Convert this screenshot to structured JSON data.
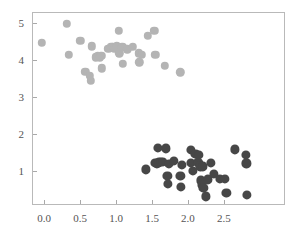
{
  "chart_data": {
    "type": "scatter",
    "title": "",
    "xlabel": "",
    "ylabel": "",
    "xlim": [
      -0.17,
      3.35
    ],
    "ylim": [
      0.08,
      5.3
    ],
    "grid": false,
    "legend": "none",
    "xticks": [
      "0.0",
      "0.5",
      "1.0",
      "1.5",
      "2.0",
      "2.5"
    ],
    "xtick_values": [
      0.0,
      0.5,
      1.0,
      1.5,
      2.0,
      2.5
    ],
    "yticks": [
      "1",
      "2",
      "3",
      "4",
      "5"
    ],
    "ytick_values": [
      1,
      2,
      3,
      4,
      5
    ],
    "series": [
      {
        "name": "cluster-light",
        "color": "#b4b4b4",
        "marker": "circle",
        "marker_size": 4.2,
        "points": [
          [
            -0.05,
            4.49
          ],
          [
            0.3,
            5.01
          ],
          [
            0.33,
            4.17
          ],
          [
            0.49,
            4.54
          ],
          [
            0.56,
            3.71
          ],
          [
            0.62,
            3.6
          ],
          [
            0.63,
            3.47
          ],
          [
            0.65,
            4.4
          ],
          [
            0.7,
            4.1
          ],
          [
            0.73,
            4.13
          ],
          [
            0.76,
            4.1
          ],
          [
            0.78,
            4.14
          ],
          [
            0.79,
            3.8
          ],
          [
            0.88,
            4.33
          ],
          [
            0.92,
            4.38
          ],
          [
            0.94,
            4.39
          ],
          [
            0.96,
            4.34
          ],
          [
            1.0,
            4.4
          ],
          [
            1.02,
            4.82
          ],
          [
            1.03,
            4.21
          ],
          [
            1.07,
            4.38
          ],
          [
            1.08,
            3.92
          ],
          [
            1.14,
            4.32
          ],
          [
            1.22,
            4.38
          ],
          [
            1.3,
            4.21
          ],
          [
            1.31,
            3.97
          ],
          [
            1.34,
            4.17
          ],
          [
            1.43,
            4.69
          ],
          [
            1.52,
            4.82
          ],
          [
            1.53,
            4.17
          ],
          [
            1.66,
            3.88
          ],
          [
            1.88,
            3.7
          ]
        ]
      },
      {
        "name": "cluster-dark",
        "color": "#474747",
        "marker": "circle",
        "marker_size": 4.6,
        "points": [
          [
            1.4,
            1.07
          ],
          [
            1.53,
            1.25
          ],
          [
            1.55,
            1.23
          ],
          [
            1.57,
            1.65
          ],
          [
            1.58,
            1.26
          ],
          [
            1.61,
            1.27
          ],
          [
            1.64,
            1.28
          ],
          [
            1.68,
            1.64
          ],
          [
            1.7,
            0.9
          ],
          [
            1.71,
            0.67
          ],
          [
            1.72,
            1.22
          ],
          [
            1.79,
            1.31
          ],
          [
            1.88,
            0.9
          ],
          [
            1.89,
            0.59
          ],
          [
            1.9,
            1.2
          ],
          [
            2.03,
            1.6
          ],
          [
            2.03,
            1.24
          ],
          [
            2.05,
            1.03
          ],
          [
            2.09,
            1.49
          ],
          [
            2.12,
            1.27
          ],
          [
            2.13,
            1.25
          ],
          [
            2.14,
            1.47
          ],
          [
            2.16,
            1.15
          ],
          [
            2.17,
            0.77
          ],
          [
            2.18,
            0.64
          ],
          [
            2.19,
            1.15
          ],
          [
            2.2,
            0.58
          ],
          [
            2.24,
            0.34
          ],
          [
            2.26,
            0.8
          ],
          [
            2.3,
            1.24
          ],
          [
            2.35,
            0.95
          ],
          [
            2.43,
            0.82
          ],
          [
            2.5,
            0.82
          ],
          [
            2.52,
            0.44
          ],
          [
            2.64,
            1.61
          ],
          [
            2.79,
            1.46
          ],
          [
            2.8,
            1.23
          ],
          [
            2.81,
            0.37
          ]
        ]
      }
    ]
  },
  "axes": {
    "frame_color": "#b9b9b9",
    "tick_color": "#a9a9a9",
    "label_color": "#545454"
  }
}
